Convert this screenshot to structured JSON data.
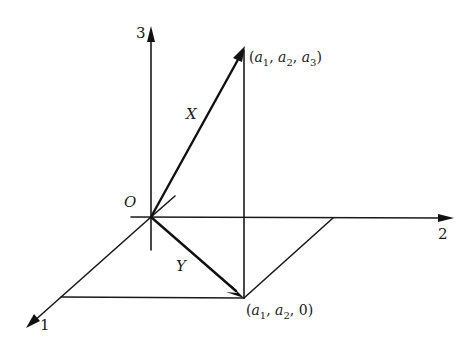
{
  "diagram": {
    "title": "",
    "axes": {
      "axis1_label": "1",
      "axis2_label": "2",
      "axis3_label": "3"
    },
    "origin_label": "O",
    "vectors": {
      "X_label": "X",
      "Y_label": "Y"
    },
    "points": {
      "top": {
        "open": "(",
        "a1": "a",
        "s1": "1",
        "sep1": ", ",
        "a2": "a",
        "s2": "2",
        "sep2": ", ",
        "a3": "a",
        "s3": "3",
        "close": ")"
      },
      "bottom": {
        "open": "(",
        "a1": "a",
        "s1": "1",
        "sep1": ", ",
        "a2": "a",
        "s2": "2",
        "sep2": ", ",
        "last": "0",
        "close": ")"
      }
    },
    "colors": {
      "ink": "#111111",
      "background": "#ffffff"
    }
  }
}
